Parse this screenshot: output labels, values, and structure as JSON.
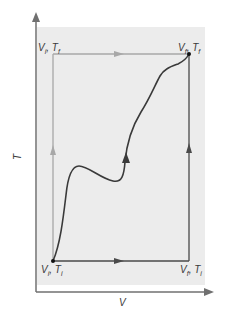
{
  "diagram": {
    "title": "",
    "axes": {
      "x_label": "V",
      "y_label": "T"
    },
    "points": {
      "initial": "Vᵢ, Tᵢ",
      "top_left": "Vᵢ, T_f",
      "top_right": "V_f, T_f",
      "bottom_right": "V_f, Tᵢ"
    },
    "point_labels": {
      "initial": {
        "v": "V",
        "v_sub": "i",
        "t": "T",
        "t_sub": "i"
      },
      "top_left": {
        "v": "V",
        "v_sub": "i",
        "t": "T",
        "t_sub": "f"
      },
      "top_right": {
        "v": "V",
        "v_sub": "f",
        "t": "T",
        "t_sub": "f"
      },
      "bottom_right": {
        "v": "V",
        "v_sub": "f",
        "t": "T",
        "t_sub": "i"
      }
    },
    "paths": [
      {
        "name": "path-vi-ti-to-vi-tf-to-vf-tf",
        "description": "Up then right (light gray)",
        "color": "#a8a8a8"
      },
      {
        "name": "path-vi-ti-to-vf-ti-to-vf-tf",
        "description": "Right then up (dark gray)",
        "color": "#4a4a4a"
      },
      {
        "name": "path-curve",
        "description": "Arbitrary curved path",
        "color": "#3a3a3a"
      }
    ],
    "colors": {
      "panel_bg": "#ececec",
      "axis": "#707070",
      "light_path": "#a8a8a8",
      "dark_path": "#4a4a4a",
      "curve": "#3a3a3a",
      "text": "#3a3a3a"
    }
  }
}
